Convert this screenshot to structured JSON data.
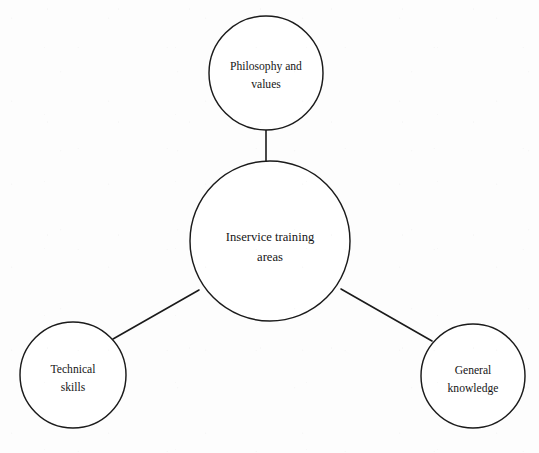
{
  "diagram": {
    "type": "hub-and-spoke",
    "title_text": "Inservice training areas",
    "background_color": "#fdfdfd",
    "stroke_color": "#1b1b1b",
    "text_color": "#161616",
    "center": {
      "label_line1": "Inservice training",
      "label_line2": "areas",
      "cx": 270,
      "cy": 241,
      "r": 80
    },
    "nodes": [
      {
        "id": "philosophy-and-values",
        "label_line1": "Philosophy and",
        "label_line2": "values",
        "cx": 266,
        "cy": 73,
        "r": 57,
        "position": "top"
      },
      {
        "id": "technical-skills",
        "label_line1": "Technical",
        "label_line2": "skills",
        "cx": 73,
        "cy": 375,
        "r": 53,
        "position": "bottom-left"
      },
      {
        "id": "general-knowledge",
        "label_line1": "General",
        "label_line2": "knowledge",
        "cx": 473,
        "cy": 376,
        "r": 52,
        "position": "bottom-right"
      }
    ],
    "connectors": [
      {
        "id": "center-to-philosophy",
        "x1": 266,
        "y1": 162,
        "x2": 266,
        "y2": 130
      },
      {
        "id": "center-to-technical",
        "x1": 199,
        "y1": 290,
        "x2": 113,
        "y2": 339
      },
      {
        "id": "center-to-general",
        "x1": 341,
        "y1": 289,
        "x2": 432,
        "y2": 341
      }
    ]
  }
}
